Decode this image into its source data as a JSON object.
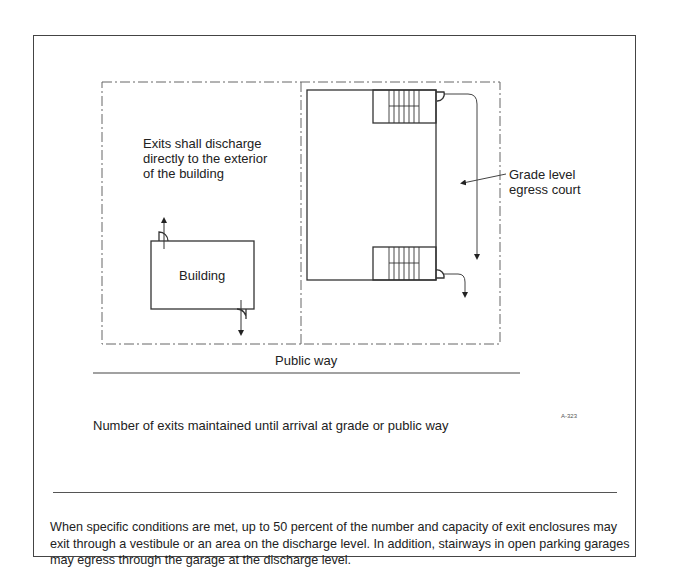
{
  "figure": {
    "left_zone_note": [
      "Exits shall discharge",
      "directly to the exterior",
      "of the building"
    ],
    "building_label": "Building",
    "egress_court_label": [
      "Grade level",
      "egress court"
    ],
    "public_way_label": "Public way",
    "figure_title": "Number of exits maintained until arrival at grade or public way",
    "figure_id": "A-323"
  },
  "caption": {
    "text": "When specific conditions are met, up to 50 percent of the number and capacity of exit enclosures may exit through a vestibule or an area on the discharge level. In addition, stairways in open parking garages may egress through the garage at the discharge level."
  },
  "colors": {
    "line": "#333333",
    "dash": "#666666",
    "frame": "#444444"
  }
}
